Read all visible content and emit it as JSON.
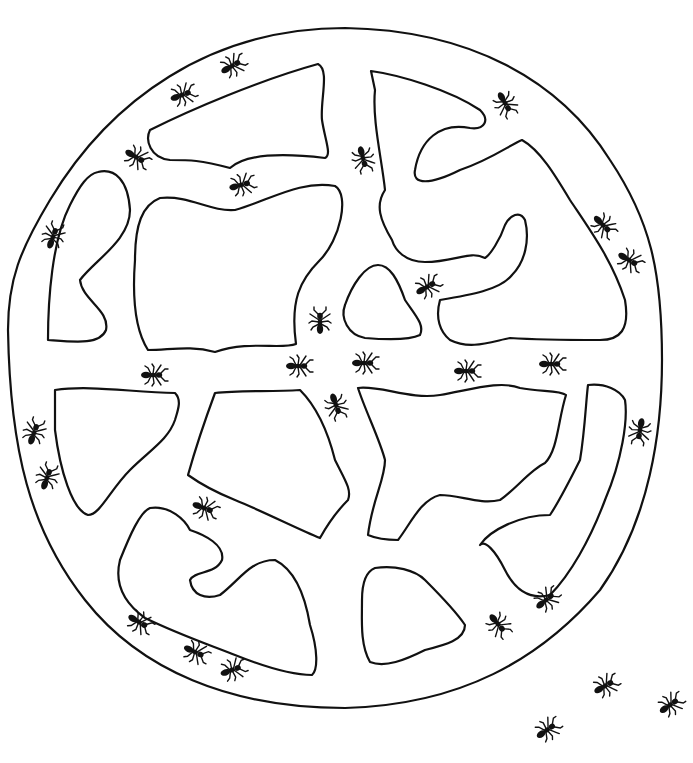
{
  "illustration": {
    "subject": "ant nest maze line drawing",
    "colors": {
      "stroke": "#111111",
      "background": "#ffffff"
    },
    "outer_ring": "M345,28 C470,30 560,80 610,160 C650,220 662,270 662,360 C662,430 650,520 600,590 C540,660 460,705 345,708 C230,708 140,670 85,600 C30,530 10,450 8,330 C8,280 20,250 50,200 C110,100 210,28 345,28 Z",
    "chambers": [
      {
        "name": "chamber-top-left",
        "d": "M150,130 C190,110 260,80 318,64 C330,70 320,100 322,120 C325,140 332,155 325,158 C300,155 250,150 230,168 C200,160 190,160 170,160 C150,158 145,140 150,130 Z"
      },
      {
        "name": "chamber-left-tall",
        "d": "M98,172 C115,168 128,180 130,210 C130,240 95,260 80,280 C82,300 110,310 106,330 C100,345 75,342 48,340 C48,300 52,240 70,205 C80,185 88,174 98,172 Z"
      },
      {
        "name": "chamber-center-big",
        "d": "M160,198 C190,195 210,212 235,210 C270,200 300,180 335,186 C350,195 340,240 320,260 C300,280 290,300 296,344 C280,350 250,340 215,352 C190,345 170,350 148,350 C135,330 132,300 135,260 C135,225 142,205 160,198 Z"
      },
      {
        "name": "chamber-top-right",
        "d": "M371,71 C400,75 450,90 480,110 C490,120 485,130 470,128 C440,122 420,140 415,170 C412,185 430,185 460,170 C490,160 510,145 522,140 C540,150 555,175 570,200 C590,230 612,260 625,300 C630,330 620,340 600,340 C570,340 540,340 510,338 C490,342 470,350 450,340 C440,332 435,318 440,300 C470,295 500,290 512,275 C525,262 530,240 525,220 C520,210 510,215 505,225 C500,240 490,255 485,258 C470,250 455,262 425,262 C405,262 395,250 392,240 C380,220 375,205 385,190 C382,160 372,120 375,90 Z"
      },
      {
        "name": "chamber-center-small",
        "d": "M378,265 C390,265 398,280 405,300 C415,315 425,325 420,335 C410,340 390,340 365,338 C348,335 340,318 345,305 C352,285 365,265 378,265 Z"
      },
      {
        "name": "chamber-mid-left",
        "d": "M55,390 C90,385 130,392 175,393 C182,400 178,410 175,420 C168,440 150,450 130,470 C110,490 100,515 88,515 C72,510 60,470 55,430 Z"
      },
      {
        "name": "chamber-mid-center",
        "d": "M215,393 C240,390 270,392 300,390 C320,410 330,440 335,460 C345,480 352,490 348,500 C338,510 330,520 320,538 C300,530 260,510 235,500 C210,490 195,480 188,475 C195,450 205,420 215,393 Z"
      },
      {
        "name": "chamber-mid-right",
        "d": "M358,388 C380,385 410,400 440,395 C470,390 500,380 520,388 C540,392 560,390 566,395 C558,420 558,450 545,463 C530,470 515,490 500,500 C480,505 460,495 440,495 C420,500 410,525 398,540 C385,540 375,538 368,535 C372,500 385,480 385,460 C380,440 365,410 358,388 Z"
      },
      {
        "name": "chamber-right-curve",
        "d": "M588,385 C605,383 620,390 625,400 C628,420 622,460 605,500 C590,540 570,575 550,595 C530,600 515,590 505,570 C495,550 485,540 480,545 C490,530 520,515 550,515 C560,500 570,480 580,460 C585,430 586,400 588,385 Z"
      },
      {
        "name": "chamber-bottom-left",
        "d": "M150,508 C170,505 185,520 190,530 C205,535 225,545 222,560 C215,575 195,570 190,580 C192,595 205,600 220,595 C240,580 250,560 275,560 C295,570 305,595 310,625 C318,650 318,670 312,675 C290,675 260,665 235,655 C210,645 180,635 145,618 C120,600 115,580 120,560 C130,535 140,512 150,508 Z"
      },
      {
        "name": "chamber-bottom-center",
        "d": "M375,568 C395,565 415,570 425,580 C440,595 455,610 465,625 C465,640 445,645 425,650 C405,660 385,668 370,662 C360,645 362,620 362,600 C362,585 365,572 375,568 Z"
      }
    ],
    "ants": [
      {
        "x": 232,
        "y": 66,
        "rot": -30
      },
      {
        "x": 182,
        "y": 95,
        "rot": -20
      },
      {
        "x": 136,
        "y": 157,
        "rot": 30
      },
      {
        "x": 241,
        "y": 185,
        "rot": -15
      },
      {
        "x": 53,
        "y": 237,
        "rot": -70
      },
      {
        "x": 363,
        "y": 158,
        "rot": 75
      },
      {
        "x": 505,
        "y": 103,
        "rot": 60
      },
      {
        "x": 603,
        "y": 225,
        "rot": 45
      },
      {
        "x": 629,
        "y": 260,
        "rot": 30
      },
      {
        "x": 427,
        "y": 287,
        "rot": -30
      },
      {
        "x": 320,
        "y": 322,
        "rot": -90
      },
      {
        "x": 153,
        "y": 375,
        "rot": 0
      },
      {
        "x": 298,
        "y": 366,
        "rot": 0
      },
      {
        "x": 364,
        "y": 363,
        "rot": 0
      },
      {
        "x": 466,
        "y": 371,
        "rot": 0
      },
      {
        "x": 551,
        "y": 364,
        "rot": 0
      },
      {
        "x": 336,
        "y": 405,
        "rot": 70
      },
      {
        "x": 34,
        "y": 433,
        "rot": -70
      },
      {
        "x": 47,
        "y": 478,
        "rot": -70
      },
      {
        "x": 640,
        "y": 430,
        "rot": 100
      },
      {
        "x": 204,
        "y": 508,
        "rot": 20
      },
      {
        "x": 139,
        "y": 622,
        "rot": 30
      },
      {
        "x": 195,
        "y": 652,
        "rot": 25
      },
      {
        "x": 232,
        "y": 670,
        "rot": -20
      },
      {
        "x": 498,
        "y": 624,
        "rot": 50
      },
      {
        "x": 546,
        "y": 600,
        "rot": -40
      },
      {
        "x": 605,
        "y": 686,
        "rot": -30
      },
      {
        "x": 670,
        "y": 705,
        "rot": -35
      },
      {
        "x": 547,
        "y": 730,
        "rot": -35
      }
    ]
  }
}
